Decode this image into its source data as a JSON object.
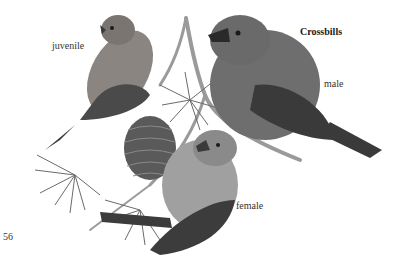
{
  "page": {
    "title": "Crossbills",
    "page_number": "56",
    "labels": {
      "juvenile": "juvenile",
      "male": "male",
      "female": "female"
    }
  },
  "illustration": {
    "subject": "crossbill-birds-on-larch-branch",
    "colors": {
      "background": "#ffffff",
      "male_body": "#6e6e6e",
      "male_wing": "#3a3a3a",
      "juvenile_body": "#8a8580",
      "juvenile_streak": "#4a4a4a",
      "female_body": "#a0a0a0",
      "female_wing": "#3c3c3c",
      "cone": "#5a5a5a",
      "branch": "#9a9a9a",
      "needles": "#6a6a6a"
    }
  }
}
